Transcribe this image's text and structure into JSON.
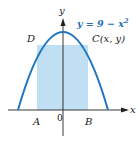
{
  "diagram": {
    "equation": "y = 9 − x",
    "equation_exponent": "2",
    "axis_labels": {
      "x": "x",
      "y": "y"
    },
    "origin_label": "0",
    "points": {
      "A": "A",
      "B": "B",
      "C": "C(x, y)",
      "D": "D"
    },
    "colors": {
      "curve": "#1f78c1",
      "rectangle_fill": "#b9dcf2",
      "axis": "#222222",
      "equation_text": "#1f6fb5"
    }
  }
}
